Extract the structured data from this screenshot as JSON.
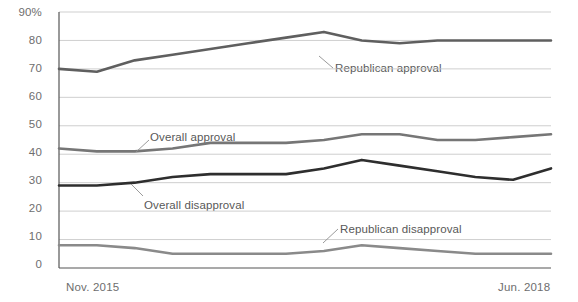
{
  "chart_data": {
    "type": "line",
    "title": "",
    "subtitle": "",
    "xlabel": "",
    "ylabel": "",
    "ylim": [
      0,
      90
    ],
    "ytick_labels": [
      "90%",
      "80",
      "70",
      "60",
      "50",
      "40",
      "30",
      "20",
      "10",
      "0"
    ],
    "ytick_values": [
      90,
      80,
      70,
      60,
      50,
      40,
      30,
      20,
      10,
      0
    ],
    "xtick_labels": [
      "Nov. 2015",
      "Jun. 2018"
    ],
    "x_start_label": "Nov. 2015",
    "x_end_label": "Jun. 2018",
    "grid": "horizontal",
    "legend_position": "inline-annotations",
    "x": [
      0,
      1,
      2,
      3,
      4,
      5,
      6,
      7,
      8,
      9,
      10,
      11,
      12,
      13
    ],
    "series": [
      {
        "name": "Republican approval",
        "color": "#5f5f5f",
        "label_text": "Republican approval",
        "values": [
          70,
          69,
          73,
          75,
          77,
          79,
          81,
          83,
          80,
          79,
          80,
          80,
          80,
          80
        ]
      },
      {
        "name": "Overall approval",
        "color": "#767676",
        "label_text": "Overall approval",
        "values": [
          42,
          41,
          41,
          42,
          44,
          44,
          44,
          45,
          47,
          47,
          45,
          45,
          46,
          47
        ]
      },
      {
        "name": "Overall disapproval",
        "color": "#2e2e2e",
        "label_text": "Overall disapproval",
        "values": [
          29,
          29,
          30,
          32,
          33,
          33,
          33,
          35,
          38,
          36,
          34,
          32,
          31,
          35
        ]
      },
      {
        "name": "Republican disapproval",
        "color": "#8a8a8a",
        "label_text": "Republican disapproval",
        "values": [
          8,
          8,
          7,
          5,
          5,
          5,
          5,
          6,
          8,
          7,
          6,
          5,
          5,
          5
        ]
      }
    ],
    "annotations": [
      {
        "text": "Republican approval",
        "series": "Republican approval"
      },
      {
        "text": "Overall approval",
        "series": "Overall approval"
      },
      {
        "text": "Overall disapproval",
        "series": "Overall disapproval"
      },
      {
        "text": "Republican disapproval",
        "series": "Republican disapproval"
      }
    ]
  },
  "axis": {
    "y_labels": [
      "90%",
      "80",
      "70",
      "60",
      "50",
      "40",
      "30",
      "20",
      "10",
      "0"
    ],
    "x_left": "Nov. 2015",
    "x_right": "Jun. 2018"
  },
  "labels": {
    "republican_approval": "Republican approval",
    "overall_approval": "Overall approval",
    "overall_disapproval": "Overall disapproval",
    "republican_disapproval": "Republican disapproval"
  },
  "colors": {
    "republican_approval": "#5f5f5f",
    "overall_approval": "#767676",
    "overall_disapproval": "#2e2e2e",
    "republican_disapproval": "#8a8a8a",
    "grid": "#c9c9c9",
    "axis": "#555555",
    "background": "#ffffff"
  }
}
